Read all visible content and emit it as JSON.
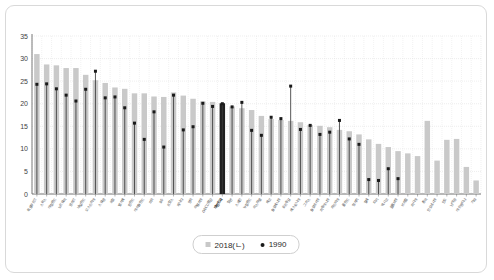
{
  "legend": {
    "series_2018_label": "2018(ㄴ)",
    "series_1990_label": "1990",
    "swatch_icon": "bar-swatch",
    "dot_icon": "dot-marker"
  },
  "axis": {
    "y_ticks": [
      "0",
      "5",
      "10",
      "15",
      "20",
      "25",
      "30",
      "35"
    ],
    "y_min": 0,
    "y_max": 35,
    "y_step": 5
  },
  "colors": {
    "bar_2018": "#c9c9c9",
    "bar_highlight": "#1f1f1f",
    "dot_1990": "#1a1a1a",
    "stem_1990": "#3a3a3a",
    "grid": "#e3e3e3",
    "axis": "#6b6b6b",
    "frame": "#d9d9d9"
  },
  "chart_data": {
    "type": "bar",
    "title": "",
    "subtitle": "",
    "xlabel": "",
    "ylabel": "",
    "ylim": [
      0,
      35
    ],
    "grid": true,
    "legend_position": "bottom",
    "highlight_index": 19,
    "categories": [
      "룩셈부르크",
      "스위스",
      "아일랜드",
      "노르웨이",
      "덴마크",
      "네덜란드",
      "오스트리아",
      "스웨덴",
      "독일",
      "벨기에",
      "핀란드",
      "아이슬란드",
      "미국",
      "호주",
      "프랑스",
      "캐나다",
      "영국",
      "이탈리아",
      "OECD평균",
      "대한민국",
      "일본",
      "스페인",
      "뉴질랜드",
      "이스라엘",
      "체코",
      "슬로베니아",
      "포르투갈",
      "에스토니아",
      "그리스",
      "슬로바키아",
      "리투아니아",
      "라트비아",
      "폴란드",
      "헝가리",
      "칠레",
      "터키",
      "멕시코",
      "콜롬비아",
      "브라질",
      "러시아",
      "중국",
      "인도네시아",
      "인도",
      "남아공",
      "아르헨티나",
      "기타"
    ],
    "series": [
      {
        "name": "2018(ㄴ)",
        "type": "bar",
        "values": [
          31.0,
          28.7,
          28.5,
          27.9,
          27.9,
          26.4,
          25.2,
          24.6,
          23.6,
          23.3,
          22.3,
          22.3,
          21.6,
          21.5,
          22.5,
          21.8,
          21.1,
          20.5,
          20.4,
          20.1,
          19.4,
          19.0,
          18.6,
          17.3,
          16.6,
          16.4,
          16.2,
          15.9,
          15.3,
          15.1,
          14.8,
          14.2,
          13.9,
          13.2,
          12.1,
          11.1,
          10.4,
          9.5,
          9.0,
          8.4,
          16.2,
          7.4,
          12.0,
          12.2,
          6.0,
          3.0
        ]
      },
      {
        "name": "1990",
        "type": "scatter",
        "values": [
          24.3,
          24.4,
          23.3,
          21.9,
          20.6,
          23.2,
          27.2,
          21.3,
          21.5,
          19.1,
          15.7,
          12.1,
          18.2,
          10.4,
          21.9,
          14.2,
          14.9,
          20.1,
          19.4,
          20.0,
          19.3,
          20.3,
          14.1,
          13.0,
          17.0,
          16.7,
          23.9,
          14.3,
          15.2,
          13.2,
          13.7,
          16.3,
          12.2,
          11.0,
          3.2,
          3.0,
          5.6,
          3.4,
          null,
          null,
          null,
          null,
          null,
          null,
          null,
          null
        ]
      }
    ]
  }
}
